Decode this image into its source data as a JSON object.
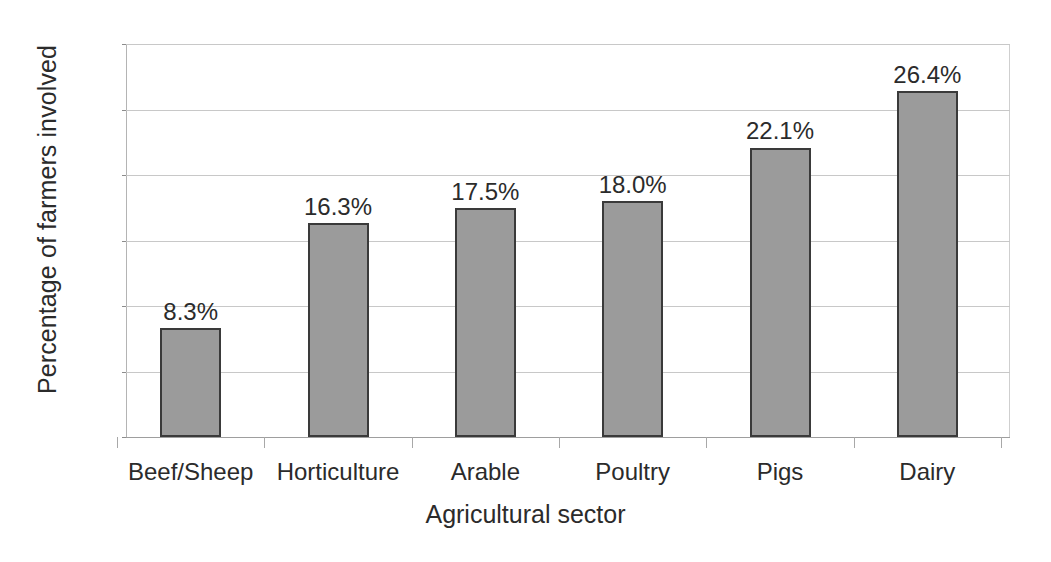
{
  "chart_data": {
    "type": "bar",
    "title": "",
    "xlabel": "Agricultural sector",
    "ylabel": "Percentage of farmers involved",
    "categories": [
      "Beef/Sheep",
      "Horticulture",
      "Arable",
      "Poultry",
      "Pigs",
      "Dairy"
    ],
    "values": [
      8.3,
      16.3,
      17.5,
      18.0,
      22.1,
      26.4
    ],
    "data_labels": [
      "8.3%",
      "16.3%",
      "17.5%",
      "18.0%",
      "22.1%",
      "26.4%"
    ],
    "ylim": [
      0,
      30
    ],
    "ytick_values": [
      0,
      5,
      10,
      15,
      20,
      25,
      30
    ],
    "ytick_labels": [
      "0",
      "5",
      "10",
      "15",
      "20",
      "25",
      "30"
    ],
    "grid": true,
    "grid_axis": "y",
    "legend": false,
    "legend_position": "none",
    "bar_fill_color": "#9b9b9b",
    "bar_border_color": "#3a3a3a",
    "gridline_color": "#c8c8c8",
    "text_color": "#2b2b2b",
    "background_color": "#ffffff"
  }
}
